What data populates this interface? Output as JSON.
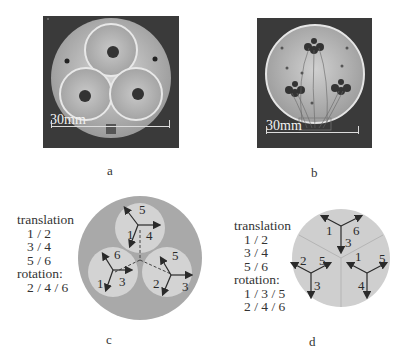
{
  "figure": {
    "panels": [
      {
        "id": "a",
        "label": "a",
        "type": "photo",
        "scalebar": "30mm",
        "description": "three-module circular device photo, top view"
      },
      {
        "id": "b",
        "label": "b",
        "type": "photo",
        "scalebar": "30mm",
        "description": "circular device with wired actuators photo"
      },
      {
        "id": "c",
        "label": "c",
        "type": "schematic",
        "legend": {
          "translation_title": "translation",
          "translation_pairs": [
            "1 / 2",
            "3 / 4",
            "5 / 6"
          ],
          "rotation_title": "rotation:",
          "rotation_groups": [
            "2 / 4 / 6"
          ]
        },
        "modules": [
          {
            "position": "top",
            "labels": [
              "5",
              "4",
              "1"
            ]
          },
          {
            "position": "bottom-left",
            "labels": [
              "6",
              "3",
              "1"
            ]
          },
          {
            "position": "bottom-right",
            "labels": [
              "5",
              "3",
              "2"
            ]
          }
        ]
      },
      {
        "id": "d",
        "label": "d",
        "type": "schematic",
        "legend": {
          "translation_title": "translation",
          "translation_pairs": [
            "1 / 2",
            "3 / 4",
            "5 / 6"
          ],
          "rotation_title": "rotation:",
          "rotation_groups": [
            "1 / 3 / 5",
            "2 / 4 / 6"
          ]
        },
        "modules": [
          {
            "position": "top",
            "labels": [
              "1",
              "6",
              "3"
            ]
          },
          {
            "position": "left",
            "labels": [
              "2",
              "5",
              "3"
            ]
          },
          {
            "position": "right",
            "labels": [
              "1",
              "5",
              "4"
            ]
          }
        ]
      }
    ],
    "colors": {
      "photo_bg": "#3a3a3a",
      "disc_outer": "#a9a9a9",
      "disc_inner": "#d3d3d3",
      "disc_d": "#cfcfcf",
      "arrow": "#2a2a2a"
    }
  }
}
